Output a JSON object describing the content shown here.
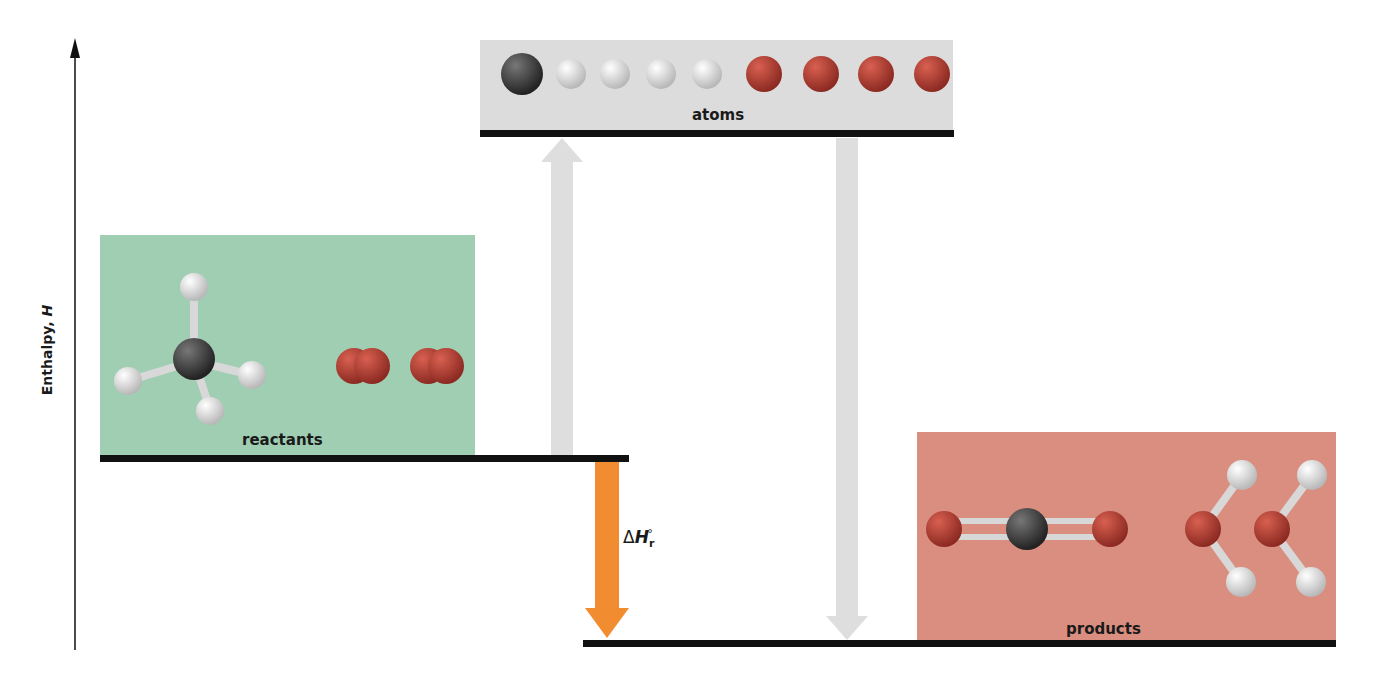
{
  "diagram": {
    "type": "enthalpy-level-diagram",
    "axis": {
      "label_text": "Enthalpy, ",
      "label_var": "H",
      "direction": "up"
    },
    "levels": [
      {
        "id": "atoms",
        "label": "atoms",
        "color": "#dcdcdc",
        "contents": [
          "C",
          "H",
          "H",
          "H",
          "H",
          "O",
          "O",
          "O",
          "O"
        ]
      },
      {
        "id": "reactants",
        "label": "reactants",
        "color": "#9fceb2",
        "contents": [
          "CH4",
          "O2",
          "O2"
        ]
      },
      {
        "id": "products",
        "label": "products",
        "color": "#d98e80",
        "contents": [
          "CO2",
          "H2O",
          "H2O"
        ]
      }
    ],
    "arrows": [
      {
        "from": "reactants",
        "to": "atoms",
        "color": "#dedede"
      },
      {
        "from": "atoms",
        "to": "products",
        "color": "#dedede"
      },
      {
        "from": "reactants",
        "to": "products",
        "color": "#f28c30",
        "label": "ΔH°r"
      }
    ],
    "delta_h": {
      "symbol": "Δ",
      "var": "H",
      "sub": "r",
      "sup": "°"
    },
    "colors": {
      "carbon": "#3a3a38",
      "hydrogen": "#f2f2f2",
      "oxygen": "#b83a30",
      "bond": "#d8d8d8",
      "level_line": "#111111"
    }
  }
}
